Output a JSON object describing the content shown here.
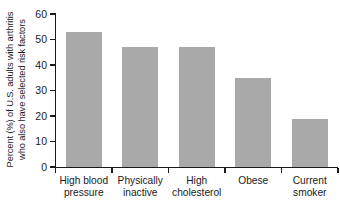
{
  "chart_data": {
    "type": "bar",
    "title": "",
    "xlabel": "",
    "ylabel": "Percent (%) of U.S. adults with arthritis who also have selected risk factors",
    "ylabel_line1": "Percent (%) of U.S. adults with arthritis",
    "ylabel_line2": "who also have selected risk factors",
    "categories": [
      "High blood pressure",
      "Physically inactive",
      "High cholesterol",
      "Obese",
      "Current smoker"
    ],
    "category_lines": [
      [
        "High blood",
        "pressure"
      ],
      [
        "Physically",
        "inactive"
      ],
      [
        "High",
        "cholesterol"
      ],
      [
        "Obese",
        ""
      ],
      [
        "Current",
        "smoker"
      ]
    ],
    "values": [
      53,
      47,
      47,
      35,
      19
    ],
    "ylim": [
      0,
      60
    ],
    "yticks": [
      0,
      10,
      20,
      30,
      40,
      50,
      60
    ],
    "ytick_labels": [
      "0",
      "10",
      "20",
      "30",
      "40",
      "50",
      "60"
    ],
    "grid": false,
    "legend": false,
    "legend_position": "none",
    "bar_color": "#a9a9a9",
    "axis_color": "#1a1a1a",
    "background_color": "#ffffff"
  }
}
